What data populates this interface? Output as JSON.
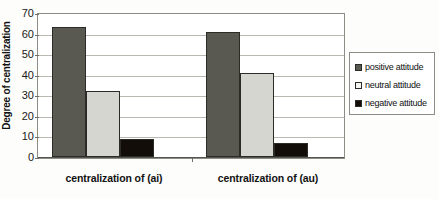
{
  "chart_data": {
    "type": "bar",
    "title": "",
    "xlabel": "",
    "ylabel": "Degree of centralization",
    "ylim": [
      0,
      70
    ],
    "ytick_step": 10,
    "yticks": [
      70,
      60,
      50,
      40,
      30,
      20,
      10,
      0
    ],
    "grid": true,
    "legend_position": "right",
    "categories": [
      "centralization of (ai)",
      "centralization of (au)"
    ],
    "series": [
      {
        "name": "positive attitude",
        "color": "#595952",
        "values": [
          63,
          61
        ]
      },
      {
        "name": "neutral attitude",
        "color": "#d6d6d0",
        "values": [
          32,
          41
        ]
      },
      {
        "name": "negative attitude",
        "color": "#130d0a",
        "values": [
          9,
          7
        ]
      }
    ]
  },
  "legend": {
    "items": [
      {
        "label": "positive attitude",
        "swatch": "#595952"
      },
      {
        "label": "neutral attitude",
        "swatch": "#f4f4f0"
      },
      {
        "label": "negative attitude",
        "swatch": "#130d0a"
      }
    ]
  }
}
